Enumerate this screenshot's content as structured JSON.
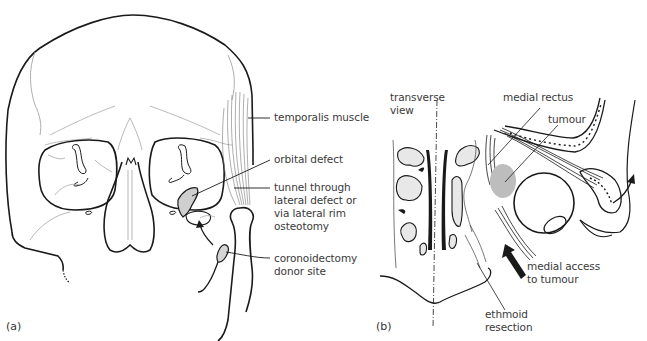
{
  "figure": {
    "panel_a": {
      "panel_label": "(a)",
      "title": "Anterior view of skull",
      "labels": {
        "temporalis": "temporalis muscle",
        "orbital_defect": "orbital defect",
        "tunnel": "tunnel through\nlateral defect or\nvia lateral rim\nosteotomy",
        "coronoid": "coronoidectomy\ndonor site"
      }
    },
    "panel_b": {
      "panel_label": "(b)",
      "labels": {
        "transverse": "transverse\nview",
        "medial_rectus": "medial rectus",
        "tumour": "tumour",
        "medial_access": "medial access\nto tumour",
        "ethmoid": "ethmoid\nresection"
      }
    },
    "colors": {
      "line": "#1a1a1a",
      "thin_line": "#9a9a9a",
      "tumour_fill": "#bdbdbd",
      "text": "#3a3a3a"
    }
  }
}
